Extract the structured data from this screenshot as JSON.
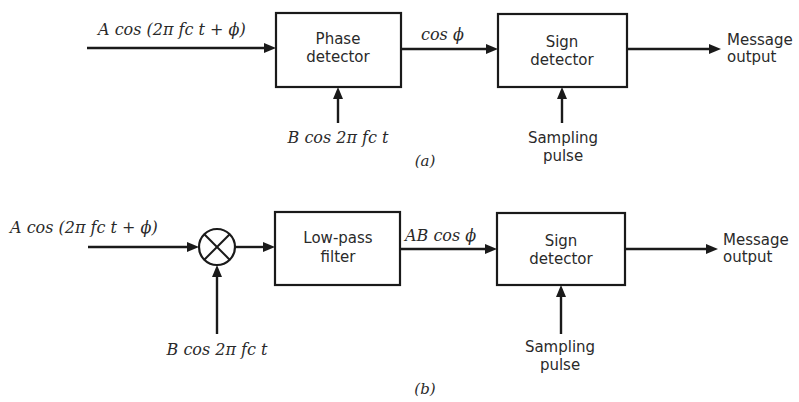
{
  "figure": {
    "part_a": {
      "caption": "(a)",
      "input_signal": "A cos (2π fc t + ϕ)",
      "block1": {
        "line1": "Phase",
        "line2": "detector"
      },
      "block1_ref_input": "B cos 2π fc t",
      "intermediate_signal": "cos ϕ",
      "block2": {
        "line1": "Sign",
        "line2": "detector"
      },
      "block2_control": {
        "line1": "Sampling",
        "line2": "pulse"
      },
      "output": {
        "line1": "Message",
        "line2": "output"
      }
    },
    "part_b": {
      "caption": "(b)",
      "input_signal": "A cos (2π fc t + ϕ)",
      "mixer_symbol": "⊗",
      "mixer_ref_input": "B cos 2π fc t",
      "block1": {
        "line1": "Low-pass",
        "line2": "filter"
      },
      "intermediate_signal": "AB cos ϕ",
      "block2": {
        "line1": "Sign",
        "line2": "detector"
      },
      "block2_control": {
        "line1": "Sampling",
        "line2": "pulse"
      },
      "output": {
        "line1": "Message",
        "line2": "output"
      }
    }
  }
}
